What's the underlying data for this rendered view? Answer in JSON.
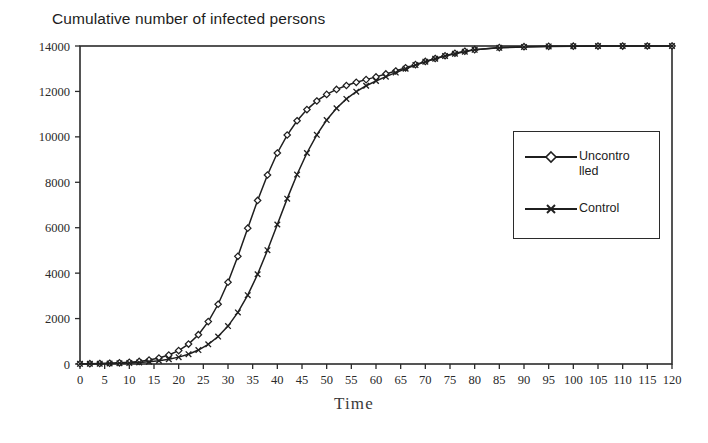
{
  "chart_data": {
    "type": "line",
    "title": "Cumulative number of infected persons",
    "xlabel": "Time",
    "ylabel": "",
    "xlim": [
      0,
      120
    ],
    "ylim": [
      0,
      14000
    ],
    "xticks": [
      0,
      5,
      10,
      15,
      20,
      25,
      30,
      35,
      40,
      45,
      50,
      55,
      60,
      65,
      70,
      75,
      80,
      85,
      90,
      95,
      100,
      105,
      110,
      115,
      120
    ],
    "yticks": [
      0,
      2000,
      4000,
      6000,
      8000,
      10000,
      12000,
      14000
    ],
    "grid": false,
    "legend_position": "right",
    "x": [
      0,
      2,
      4,
      6,
      8,
      10,
      12,
      14,
      16,
      18,
      20,
      22,
      24,
      26,
      28,
      30,
      32,
      34,
      36,
      38,
      40,
      42,
      44,
      46,
      48,
      50,
      52,
      54,
      56,
      58,
      60,
      62,
      64,
      66,
      68,
      70,
      72,
      74,
      76,
      78,
      80,
      85,
      90,
      95,
      100,
      105,
      110,
      115,
      120
    ],
    "series": [
      {
        "name": "Uncontrolled",
        "marker": "diamond",
        "color": "#1f1f1f",
        "values": [
          10,
          14,
          22,
          33,
          50,
          76,
          115,
          174,
          262,
          394,
          590,
          878,
          1290,
          1866,
          2630,
          3600,
          4740,
          5980,
          7200,
          8320,
          9290,
          10080,
          10710,
          11200,
          11580,
          11870,
          12090,
          12260,
          12400,
          12520,
          12640,
          12770,
          12900,
          13040,
          13180,
          13320,
          13450,
          13570,
          13680,
          13770,
          13840,
          13930,
          13970,
          13985,
          13993,
          13996,
          13998,
          13999,
          14000
        ]
      },
      {
        "name": "Control",
        "marker": "x",
        "color": "#1f1f1f",
        "values": [
          8,
          11,
          16,
          23,
          33,
          48,
          70,
          101,
          146,
          210,
          302,
          432,
          614,
          866,
          1208,
          1668,
          2270,
          3030,
          3950,
          5010,
          6140,
          7280,
          8340,
          9290,
          10090,
          10740,
          11260,
          11670,
          11990,
          12250,
          12460,
          12650,
          12830,
          13000,
          13160,
          13310,
          13440,
          13560,
          13660,
          13750,
          13830,
          13920,
          13960,
          13980,
          13990,
          13995,
          13997,
          13999,
          14000
        ]
      }
    ],
    "legend": [
      {
        "label_line_1": "Uncontro",
        "label_line_2": "lled",
        "marker": "diamond"
      },
      {
        "label_line_1": "Control",
        "label_line_2": "",
        "marker": "x"
      }
    ]
  }
}
